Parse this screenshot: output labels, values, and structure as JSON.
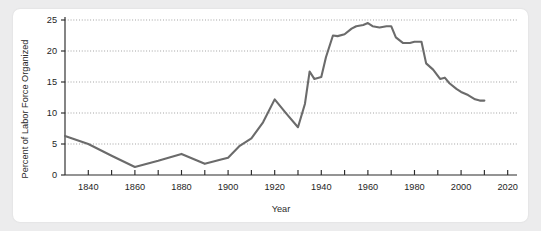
{
  "card": {
    "background": "#ffffff",
    "page_background": "#ececed"
  },
  "chart_data": {
    "type": "line",
    "title": "",
    "xlabel": "Year",
    "ylabel": "Percent of Labor Force Organized",
    "xlim": [
      1830,
      2024
    ],
    "ylim": [
      0,
      25
    ],
    "grid": true,
    "legend": false,
    "line_color": "#6b6b6b",
    "axis_color": "#2a2a2a",
    "y_ticks": [
      0,
      5,
      10,
      15,
      20,
      25
    ],
    "y_tick_labels": [
      "0",
      "5",
      "10",
      "15",
      "20",
      "25"
    ],
    "x_ticks": [
      1840,
      1850,
      1860,
      1870,
      1880,
      1890,
      1900,
      1910,
      1920,
      1930,
      1940,
      1950,
      1960,
      1970,
      1980,
      1990,
      2000,
      2010,
      2020
    ],
    "x_tick_labels": [
      "1840",
      "1860",
      "1880",
      "1900",
      "1920",
      "1940",
      "1960",
      "1980",
      "2000",
      "2020"
    ],
    "x_labeled_ticks": [
      1840,
      1860,
      1880,
      1900,
      1920,
      1940,
      1960,
      1980,
      2000,
      2020
    ],
    "x": [
      1830,
      1840,
      1850,
      1860,
      1870,
      1880,
      1890,
      1897,
      1900,
      1905,
      1910,
      1915,
      1920,
      1925,
      1930,
      1933,
      1935,
      1937,
      1940,
      1942,
      1945,
      1947,
      1950,
      1953,
      1955,
      1958,
      1960,
      1962,
      1965,
      1968,
      1970,
      1972,
      1975,
      1978,
      1980,
      1983,
      1985,
      1988,
      1991,
      1993,
      1995,
      1998,
      2000,
      2003,
      2006,
      2008,
      2010
    ],
    "y": [
      6.3,
      5.0,
      3.1,
      1.3,
      2.3,
      3.4,
      1.8,
      2.5,
      2.8,
      4.7,
      5.9,
      8.5,
      12.2,
      9.9,
      7.7,
      11.5,
      16.7,
      15.5,
      15.8,
      19.0,
      22.5,
      22.4,
      22.7,
      23.6,
      24.0,
      24.2,
      24.5,
      24.0,
      23.8,
      24.0,
      24.0,
      22.2,
      21.3,
      21.3,
      21.5,
      21.5,
      18.0,
      17.0,
      15.5,
      15.7,
      14.8,
      13.9,
      13.4,
      12.9,
      12.2,
      12.0,
      12.0
    ]
  },
  "axis_titles": {
    "x": "Year",
    "y": "Percent of Labor Force Organized"
  }
}
